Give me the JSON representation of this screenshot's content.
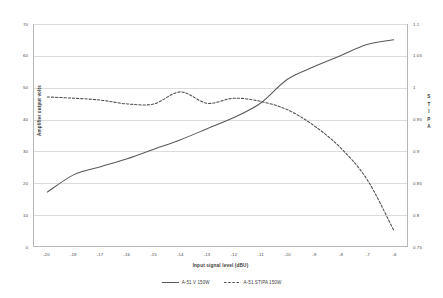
{
  "chart_data": {
    "type": "line",
    "title": "",
    "xlabel": "Input signal level (dBU)",
    "ylabel": "Amplifier output volts",
    "y2label": "STIPA",
    "categories": [
      "-20",
      "-18",
      "-17",
      "-16",
      "-15",
      "-14",
      "-13",
      "-12",
      "-11",
      "-10",
      "-9",
      "-8",
      "-7",
      "-6"
    ],
    "ylim": [
      0,
      70
    ],
    "yticks": [
      "0",
      "10",
      "20",
      "30",
      "40",
      "50",
      "60",
      "70"
    ],
    "y2lim": [
      0.75,
      1.1
    ],
    "y2ticks": [
      "0.75",
      "0.8",
      "0.85",
      "0.9",
      "0.95",
      "1",
      "1.05",
      "1.1"
    ],
    "grid": true,
    "legend_position": "bottom",
    "series": [
      {
        "name": "A-51 V 150W",
        "axis": "left",
        "style": "solid",
        "color": "#595959",
        "values": [
          17.0,
          22.5,
          25.0,
          27.5,
          30.5,
          33.5,
          37.0,
          40.5,
          45.0,
          52.5,
          56.5,
          60.0,
          63.5,
          65.0
        ]
      },
      {
        "name": "A-51 STIPA 150W",
        "axis": "right",
        "style": "dashed",
        "color": "#4d4d4d",
        "values": [
          0.985,
          0.983,
          0.98,
          0.974,
          0.974,
          0.993,
          0.975,
          0.983,
          0.978,
          0.965,
          0.94,
          0.905,
          0.855,
          0.775
        ]
      }
    ]
  },
  "legend": {
    "items": [
      {
        "label": "A-51 V 150W",
        "style": "solid"
      },
      {
        "label": "A-51 STIPA 150W",
        "style": "dashed"
      }
    ]
  },
  "axes": {
    "y_left_title": "Amplifier output volts",
    "y_right_title_chars": [
      "S",
      "T",
      "I",
      "P",
      "A"
    ],
    "x_title": "Input signal level (dBU)"
  },
  "colors": {
    "series_solid": "#595959",
    "series_dashed": "#4d4d4d",
    "gridline": "#dcdcdc",
    "axis": "#b8b8b8",
    "background": "#ffffff"
  }
}
